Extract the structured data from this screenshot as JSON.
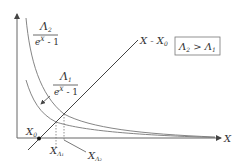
{
  "diagram": {
    "axes": {
      "x_label": "X"
    },
    "curves": [
      {
        "id": "lambda2",
        "numerator": "Λ",
        "numerator_sub": "2",
        "denominator": "e",
        "denominator_sup": "X",
        "denominator_tail": " - 1"
      },
      {
        "id": "lambda1",
        "numerator": "Λ",
        "numerator_sub": "1",
        "denominator": "e",
        "denominator_sup": "X",
        "denominator_tail": " - 1"
      }
    ],
    "line": {
      "label_main": "X - X",
      "label_sub": "0"
    },
    "points": {
      "x0": {
        "label": "X",
        "sub": "0"
      },
      "x_lambda1": {
        "label": "X",
        "sub": "Λ₁"
      },
      "x_lambda2": {
        "label": "X",
        "sub": "Λ₂"
      }
    },
    "condition_box": {
      "left": "Λ",
      "left_sub": "2",
      "op": " > ",
      "right": "Λ",
      "right_sub": "1"
    }
  }
}
